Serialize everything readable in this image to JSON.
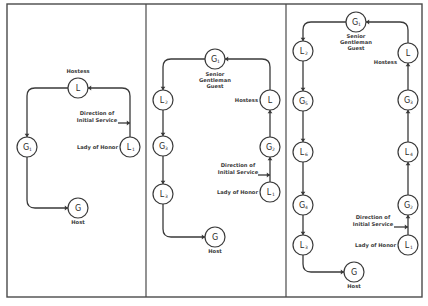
{
  "diagram": {
    "colors": {
      "line": "#3a3a3a",
      "frame": "#4a4a4a",
      "background": "#ffffff"
    },
    "frame": {
      "x": 7,
      "y": 4,
      "w": 415,
      "h": 293
    },
    "dividers": [
      146,
      286
    ],
    "panels": [
      {
        "id": "panel-1",
        "nodes": [
          {
            "id": "hostess",
            "letter": "L",
            "sub": "",
            "x": 78,
            "y": 88
          },
          {
            "id": "g1",
            "letter": "G",
            "sub": "1",
            "x": 27,
            "y": 147
          },
          {
            "id": "lady-of-honor",
            "letter": "L",
            "sub": "1",
            "x": 130,
            "y": 147
          },
          {
            "id": "host",
            "letter": "G",
            "sub": "",
            "x": 78,
            "y": 208
          }
        ],
        "labels": [
          {
            "text": "Hostess",
            "x": 78,
            "y": 73,
            "anchor": "middle"
          },
          {
            "text": "Direction of",
            "x": 97,
            "y": 115,
            "anchor": "middle"
          },
          {
            "text": "Initial Service",
            "x": 97,
            "y": 122,
            "anchor": "middle"
          },
          {
            "text": "Lady of Honor",
            "x": 118,
            "y": 149,
            "anchor": "end"
          },
          {
            "text": "Host",
            "x": 78,
            "y": 224,
            "anchor": "middle"
          }
        ],
        "paths": [
          "M130,137 L130,96 Q130,88 122,88 L88,88",
          "M68,88 L35,88 Q27,88 27,96 L27,137",
          "M27,157 L27,200 Q27,208 35,208 L68,208"
        ],
        "arrows": [
          {
            "x": 88,
            "y": 88,
            "dir": "left"
          },
          {
            "x": 27,
            "y": 137,
            "dir": "down"
          },
          {
            "x": 68,
            "y": 208,
            "dir": "right"
          },
          {
            "x": 130,
            "y": 123,
            "dir": "right-in"
          }
        ],
        "service_pointer": {
          "x1": 118,
          "y1": 123,
          "x2": 130,
          "y2": 123
        }
      },
      {
        "id": "panel-2",
        "nodes": [
          {
            "id": "senior-gentleman-guest",
            "letter": "G",
            "sub": "1",
            "x": 215,
            "y": 59
          },
          {
            "id": "l2",
            "letter": "L",
            "sub": "2",
            "x": 163,
            "y": 100
          },
          {
            "id": "g3",
            "letter": "G",
            "sub": "3",
            "x": 163,
            "y": 146
          },
          {
            "id": "l3",
            "letter": "L",
            "sub": "3",
            "x": 163,
            "y": 194
          },
          {
            "id": "host",
            "letter": "G",
            "sub": "",
            "x": 215,
            "y": 237
          },
          {
            "id": "hostess",
            "letter": "L",
            "sub": "",
            "x": 270,
            "y": 100
          },
          {
            "id": "g2",
            "letter": "G",
            "sub": "2",
            "x": 270,
            "y": 147
          },
          {
            "id": "lady-of-honor",
            "letter": "L",
            "sub": "1",
            "x": 270,
            "y": 192
          }
        ],
        "labels": [
          {
            "text": "Senior",
            "x": 215,
            "y": 76,
            "anchor": "middle"
          },
          {
            "text": "Gentleman",
            "x": 215,
            "y": 82,
            "anchor": "middle"
          },
          {
            "text": "Guest",
            "x": 215,
            "y": 88,
            "anchor": "middle"
          },
          {
            "text": "Hostess",
            "x": 258,
            "y": 102,
            "anchor": "end"
          },
          {
            "text": "Direction of",
            "x": 238,
            "y": 167,
            "anchor": "middle"
          },
          {
            "text": "Initial Service",
            "x": 238,
            "y": 174,
            "anchor": "middle"
          },
          {
            "text": "Lady of Honor",
            "x": 258,
            "y": 194,
            "anchor": "end"
          },
          {
            "text": "Host",
            "x": 215,
            "y": 253,
            "anchor": "middle"
          }
        ],
        "paths": [
          "M270,90 L270,67 Q270,59 262,59 L225,59",
          "M205,59 L171,59 Q163,59 163,67 L163,90",
          "M163,110 L163,136",
          "M163,156 L163,184",
          "M163,204 L163,229 Q163,237 171,237 L205,237",
          "M270,137 L270,110",
          "M270,182 L270,157"
        ],
        "arrows": [
          {
            "x": 225,
            "y": 59,
            "dir": "left"
          },
          {
            "x": 163,
            "y": 90,
            "dir": "down"
          },
          {
            "x": 163,
            "y": 136,
            "dir": "down"
          },
          {
            "x": 163,
            "y": 184,
            "dir": "down"
          },
          {
            "x": 205,
            "y": 237,
            "dir": "right"
          },
          {
            "x": 270,
            "y": 110,
            "dir": "up"
          },
          {
            "x": 270,
            "y": 157,
            "dir": "up"
          },
          {
            "x": 270,
            "y": 175,
            "dir": "right-in"
          }
        ],
        "service_pointer": {
          "x1": 258,
          "y1": 175,
          "x2": 270,
          "y2": 175
        }
      },
      {
        "id": "panel-3",
        "nodes": [
          {
            "id": "senior-gentleman-guest",
            "letter": "G",
            "sub": "1",
            "x": 356,
            "y": 22
          },
          {
            "id": "l2",
            "letter": "L",
            "sub": "2",
            "x": 303,
            "y": 51
          },
          {
            "id": "g5",
            "letter": "G",
            "sub": "5",
            "x": 303,
            "y": 101
          },
          {
            "id": "l6",
            "letter": "L",
            "sub": "6",
            "x": 303,
            "y": 152
          },
          {
            "id": "g4",
            "letter": "G",
            "sub": "4",
            "x": 303,
            "y": 205
          },
          {
            "id": "l3",
            "letter": "L",
            "sub": "3",
            "x": 303,
            "y": 245
          },
          {
            "id": "host",
            "letter": "G",
            "sub": "",
            "x": 354,
            "y": 272
          },
          {
            "id": "hostess",
            "letter": "L",
            "sub": "",
            "x": 408,
            "y": 53
          },
          {
            "id": "g3",
            "letter": "G",
            "sub": "3",
            "x": 408,
            "y": 100
          },
          {
            "id": "l4",
            "letter": "L",
            "sub": "4",
            "x": 408,
            "y": 152
          },
          {
            "id": "g2",
            "letter": "G",
            "sub": "2",
            "x": 408,
            "y": 205
          },
          {
            "id": "lady-of-honor",
            "letter": "L",
            "sub": "1",
            "x": 408,
            "y": 245
          }
        ],
        "labels": [
          {
            "text": "Senior",
            "x": 356,
            "y": 38,
            "anchor": "middle"
          },
          {
            "text": "Gentleman",
            "x": 356,
            "y": 44,
            "anchor": "middle"
          },
          {
            "text": "Guest",
            "x": 356,
            "y": 50,
            "anchor": "middle"
          },
          {
            "text": "Hostess",
            "x": 397,
            "y": 64,
            "anchor": "end"
          },
          {
            "text": "Direction of",
            "x": 373,
            "y": 219,
            "anchor": "middle"
          },
          {
            "text": "Initial Service",
            "x": 373,
            "y": 226,
            "anchor": "middle"
          },
          {
            "text": "Lady of Honor",
            "x": 396,
            "y": 247,
            "anchor": "end"
          },
          {
            "text": "Host",
            "x": 354,
            "y": 288,
            "anchor": "middle"
          }
        ],
        "paths": [
          "M408,43 L408,30 Q408,22 400,22 L366,22",
          "M346,22 L311,22 Q303,22 303,30 L303,41",
          "M303,61 L303,91",
          "M303,111 L303,142",
          "M303,162 L303,195",
          "M303,215 L303,235",
          "M303,255 L303,264 Q303,272 311,272 L344,272",
          "M408,90 L408,63",
          "M408,142 L408,110",
          "M408,195 L408,162",
          "M408,235 L408,215"
        ],
        "arrows": [
          {
            "x": 366,
            "y": 22,
            "dir": "left"
          },
          {
            "x": 303,
            "y": 41,
            "dir": "down"
          },
          {
            "x": 303,
            "y": 91,
            "dir": "down"
          },
          {
            "x": 303,
            "y": 142,
            "dir": "down"
          },
          {
            "x": 303,
            "y": 195,
            "dir": "down"
          },
          {
            "x": 303,
            "y": 235,
            "dir": "down"
          },
          {
            "x": 344,
            "y": 272,
            "dir": "right"
          },
          {
            "x": 408,
            "y": 63,
            "dir": "up"
          },
          {
            "x": 408,
            "y": 110,
            "dir": "up"
          },
          {
            "x": 408,
            "y": 162,
            "dir": "up"
          },
          {
            "x": 408,
            "y": 215,
            "dir": "up"
          },
          {
            "x": 408,
            "y": 227,
            "dir": "right-in"
          }
        ],
        "service_pointer": {
          "x1": 394,
          "y1": 227,
          "x2": 408,
          "y2": 227
        }
      }
    ]
  }
}
